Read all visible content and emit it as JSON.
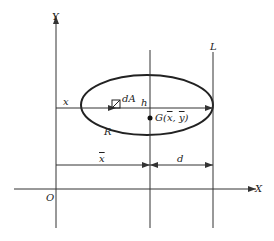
{
  "diagram": {
    "axes": {
      "x_label": "X",
      "y_label": "Y",
      "origin_label": "O"
    },
    "region": {
      "label": "R",
      "shape": "ellipse"
    },
    "element": {
      "label": "dA"
    },
    "distance_labels": {
      "x_coord": "x",
      "height": "h",
      "x_bar": "x",
      "d": "d"
    },
    "centroid": {
      "prefix": "G(",
      "x_bar": "x",
      "sep": ", ",
      "y_bar": "y",
      "suffix": ")"
    },
    "line": {
      "label": "L"
    },
    "colors": {
      "stroke": "#333333",
      "background": "#ffffff"
    }
  }
}
